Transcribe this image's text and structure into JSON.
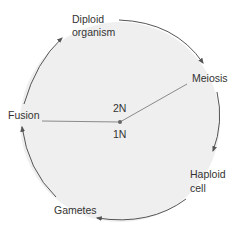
{
  "diagram": {
    "type": "life-cycle",
    "colors": {
      "disk": "#efefef",
      "arrow": "#555555",
      "line": "#8a8a8a",
      "text": "#333333",
      "dot": "#666666"
    },
    "nodes": {
      "diploid_line1": "Diploid",
      "diploid_line2": "organism",
      "meiosis": "Meiosis",
      "haploid_line1": "Haploid",
      "haploid_line2": "cell",
      "gametes": "Gametes",
      "fusion": "Fusion"
    },
    "center": {
      "upper_label": "2N",
      "lower_label": "1N"
    },
    "cycle": [
      "Diploid organism",
      "Meiosis",
      "Haploid cell",
      "Gametes",
      "Fusion"
    ]
  }
}
